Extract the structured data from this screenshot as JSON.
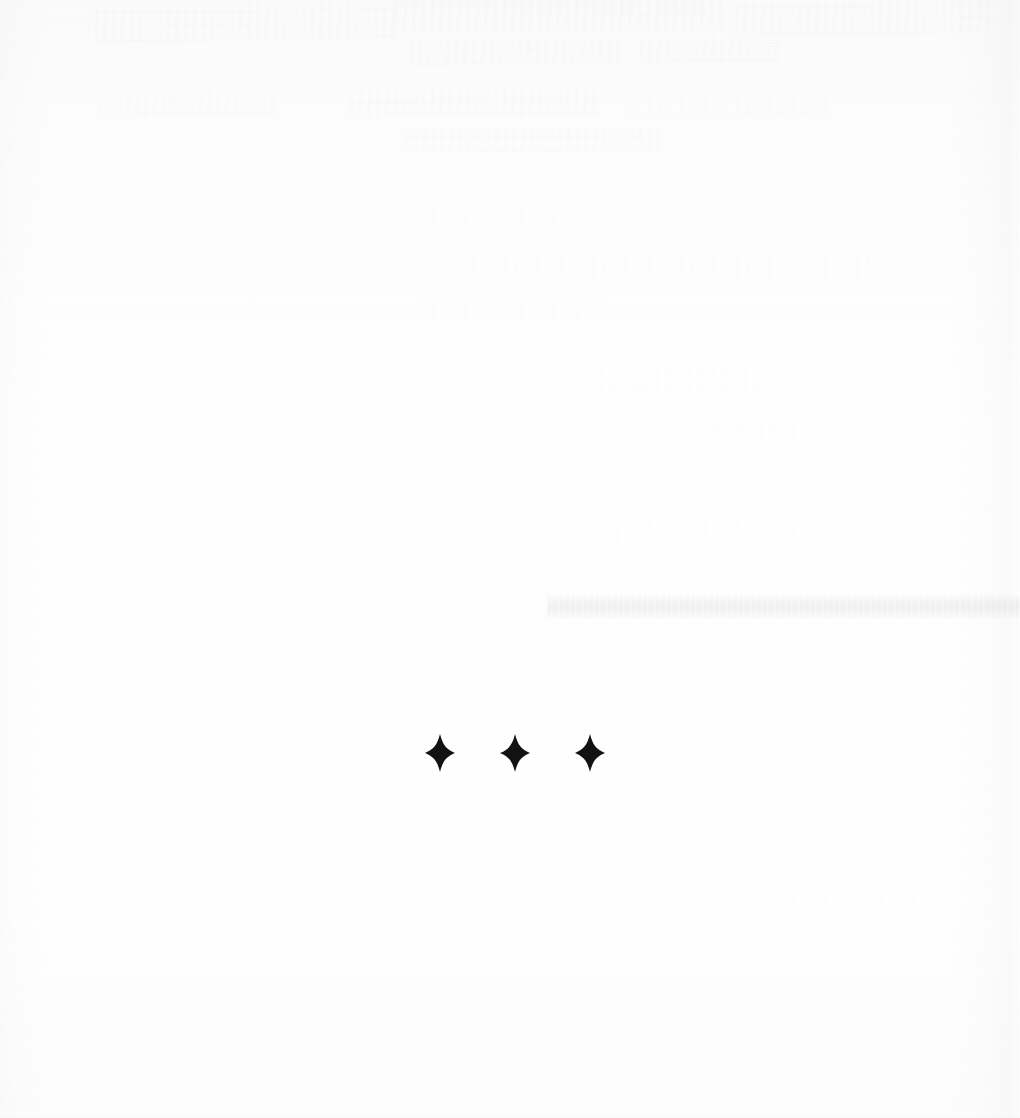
{
  "page": {
    "kind": "scanned-book-page",
    "width": 1020,
    "height": 1118,
    "background_color": "#fefefe",
    "ink_color": "#121212"
  },
  "ornament": {
    "name": "dinkus",
    "symbol": "✦",
    "glyph_name": "four-pointed-star",
    "count": 3,
    "color": "#121212",
    "center_y": 753,
    "star_width": 30,
    "star_height": 38,
    "spacing": 75,
    "stars": [
      {
        "label": "✦",
        "center_x": 440
      },
      {
        "label": "✦",
        "center_x": 515
      },
      {
        "label": "✦",
        "center_x": 590
      }
    ]
  },
  "artifacts": {
    "ghost_marks": [
      {
        "name": "ghost-top-left",
        "x": 95,
        "y": 4,
        "w": 300,
        "h": 36,
        "opacity": 0.3,
        "rotate": -0.6
      },
      {
        "name": "ghost-top-mid",
        "x": 395,
        "y": 0,
        "w": 330,
        "h": 30,
        "opacity": 0.34,
        "rotate": -0.4
      },
      {
        "name": "ghost-top-right",
        "x": 735,
        "y": 2,
        "w": 255,
        "h": 32,
        "opacity": 0.32,
        "rotate": -0.5
      },
      {
        "name": "ghost-line-2-left",
        "x": 410,
        "y": 38,
        "w": 215,
        "h": 26,
        "opacity": 0.3,
        "rotate": -0.5
      },
      {
        "name": "ghost-line-2-right",
        "x": 640,
        "y": 36,
        "w": 140,
        "h": 26,
        "opacity": 0.26,
        "rotate": -0.4
      },
      {
        "name": "ghost-line-3-left",
        "x": 100,
        "y": 92,
        "w": 175,
        "h": 24,
        "opacity": 0.26,
        "rotate": -0.5
      },
      {
        "name": "ghost-line-3-mid",
        "x": 350,
        "y": 88,
        "w": 250,
        "h": 28,
        "opacity": 0.3,
        "rotate": -0.5
      },
      {
        "name": "ghost-line-3-right",
        "x": 625,
        "y": 92,
        "w": 205,
        "h": 24,
        "opacity": 0.24,
        "rotate": -0.4
      },
      {
        "name": "ghost-line-4",
        "x": 405,
        "y": 128,
        "w": 260,
        "h": 24,
        "opacity": 0.26,
        "rotate": -0.4
      },
      {
        "name": "ghost-mid-a",
        "x": 420,
        "y": 205,
        "w": 160,
        "h": 20,
        "opacity": 0.16,
        "rotate": -0.3
      },
      {
        "name": "ghost-mid-b",
        "x": 470,
        "y": 252,
        "w": 250,
        "h": 24,
        "opacity": 0.18,
        "rotate": -0.3
      },
      {
        "name": "ghost-mid-c",
        "x": 735,
        "y": 255,
        "w": 135,
        "h": 24,
        "opacity": 0.2,
        "rotate": -0.3
      },
      {
        "name": "ghost-mid-d",
        "x": 420,
        "y": 300,
        "w": 185,
        "h": 20,
        "opacity": 0.14,
        "rotate": -0.3
      },
      {
        "name": "ghost-mid-e",
        "x": 600,
        "y": 368,
        "w": 170,
        "h": 22,
        "opacity": 0.14,
        "rotate": -0.3
      },
      {
        "name": "ghost-mid-f",
        "x": 715,
        "y": 418,
        "w": 90,
        "h": 24,
        "opacity": 0.2,
        "rotate": -0.3
      },
      {
        "name": "ghost-mid-g",
        "x": 560,
        "y": 520,
        "w": 235,
        "h": 22,
        "opacity": 0.16,
        "rotate": -0.3
      },
      {
        "name": "ghost-low-a",
        "x": 780,
        "y": 890,
        "w": 150,
        "h": 26,
        "opacity": 0.13,
        "rotate": -0.3
      },
      {
        "name": "ghost-low-b",
        "x": 620,
        "y": 915,
        "w": 120,
        "h": 20,
        "opacity": 0.1,
        "rotate": -0.3
      }
    ],
    "smudge_band": {
      "name": "horizontal-smudge-band",
      "x": 548,
      "y": 596,
      "w": 472,
      "h": 22,
      "opacity": 0.5
    }
  }
}
